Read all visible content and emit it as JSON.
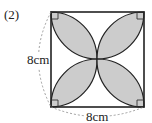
{
  "problem": {
    "number_label": "(2)"
  },
  "dimensions": {
    "left_side": "8cm",
    "bottom_side": "8cm"
  },
  "figure": {
    "shape": "square",
    "shaded_petals": 4,
    "petal_fill": "#cccccc",
    "stroke": "#222222",
    "dashed_stroke": "#888888",
    "corner_marks": "right-angle markers at each corner (unconfirmed)"
  }
}
